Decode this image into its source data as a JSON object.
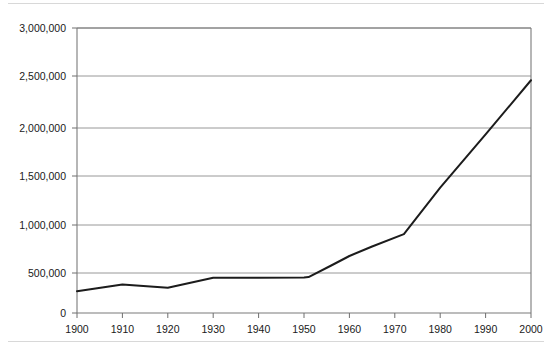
{
  "chart_data": {
    "type": "line",
    "title": "",
    "subtitle": "",
    "xlabel": "",
    "ylabel": "",
    "xlim": [
      1900,
      2000
    ],
    "ylim": [
      0,
      3000000
    ],
    "grid": true,
    "legend": false,
    "legend_position": "none",
    "x_ticks": [
      1900,
      1910,
      1920,
      1930,
      1940,
      1950,
      1960,
      1970,
      1980,
      1990,
      2000
    ],
    "x_tick_labels": [
      "1900",
      "1910",
      "1920",
      "1930",
      "1940",
      "1950",
      "1960",
      "1970",
      "1980",
      "1990",
      "2000"
    ],
    "y_ticks": [
      0,
      500000,
      1000000,
      1500000,
      2000000,
      2500000,
      3000000
    ],
    "y_tick_labels": [
      "0",
      "500,000",
      "1,000,000",
      "1,500,000",
      "2,000,000",
      "2,500,000",
      "3,000,000"
    ],
    "series": [
      {
        "name": "series-1",
        "color": "#1c1c1c",
        "x": [
          1900,
          1910,
          1920,
          1930,
          1940,
          1950,
          1951,
          1956,
          1960,
          1965,
          1972,
          1980,
          1990,
          2000
        ],
        "values": [
          230000,
          300000,
          265000,
          370000,
          372000,
          375000,
          378000,
          500000,
          600000,
          700000,
          830000,
          1320000,
          1880000,
          2450000
        ]
      }
    ],
    "annotations": []
  },
  "figure": {
    "background_color": "#ffffff",
    "frame_color": "#7a7a7a",
    "grid_color": "#8c8c8c",
    "line_color": "#1c1c1c"
  }
}
